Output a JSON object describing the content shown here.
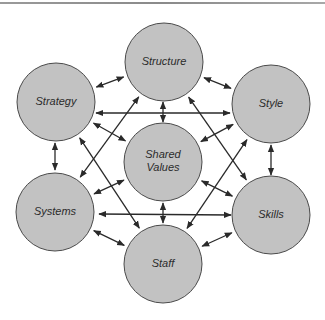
{
  "diagram": {
    "nodes": [
      {
        "id": "structure",
        "label": [
          "Structure"
        ]
      },
      {
        "id": "strategy",
        "label": [
          "Strategy"
        ]
      },
      {
        "id": "style",
        "label": [
          "Style"
        ]
      },
      {
        "id": "shared_values",
        "label": [
          "Shared",
          "Values"
        ]
      },
      {
        "id": "systems",
        "label": [
          "Systems"
        ]
      },
      {
        "id": "skills",
        "label": [
          "Skills"
        ]
      },
      {
        "id": "staff",
        "label": [
          "Staff"
        ]
      }
    ],
    "edges": [
      {
        "from": "structure",
        "to": "strategy",
        "bidirectional": true
      },
      {
        "from": "structure",
        "to": "style",
        "bidirectional": true
      },
      {
        "from": "structure",
        "to": "shared_values",
        "bidirectional": true
      },
      {
        "from": "structure",
        "to": "systems",
        "bidirectional": true
      },
      {
        "from": "structure",
        "to": "skills",
        "bidirectional": true
      },
      {
        "from": "strategy",
        "to": "style",
        "bidirectional": true
      },
      {
        "from": "strategy",
        "to": "shared_values",
        "bidirectional": true
      },
      {
        "from": "strategy",
        "to": "systems",
        "bidirectional": true
      },
      {
        "from": "strategy",
        "to": "staff",
        "bidirectional": true
      },
      {
        "from": "style",
        "to": "shared_values",
        "bidirectional": true
      },
      {
        "from": "style",
        "to": "skills",
        "bidirectional": true
      },
      {
        "from": "style",
        "to": "staff",
        "bidirectional": true
      },
      {
        "from": "systems",
        "to": "skills",
        "bidirectional": true
      },
      {
        "from": "systems",
        "to": "shared_values",
        "bidirectional": true
      },
      {
        "from": "systems",
        "to": "staff",
        "bidirectional": true
      },
      {
        "from": "skills",
        "to": "shared_values",
        "bidirectional": true
      },
      {
        "from": "skills",
        "to": "staff",
        "bidirectional": true
      },
      {
        "from": "staff",
        "to": "shared_values",
        "bidirectional": true
      }
    ],
    "colors": {
      "node_fill": "#c2c2c2",
      "node_stroke": "#4a4a4a",
      "arrow": "#2a2a2a",
      "text": "#2b2b2b"
    }
  }
}
